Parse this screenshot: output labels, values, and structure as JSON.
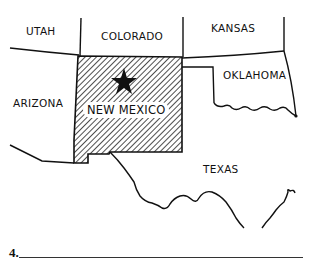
{
  "map": {
    "highlighted_state": "NEW MEXICO",
    "marker": "star-icon",
    "hatch_color": "#222222",
    "line_color": "#111111",
    "states": [
      {
        "id": "utah",
        "label": "UTAH"
      },
      {
        "id": "colorado",
        "label": "COLORADO"
      },
      {
        "id": "kansas",
        "label": "KANSAS"
      },
      {
        "id": "arizona",
        "label": "ARIZONA"
      },
      {
        "id": "new-mexico",
        "label": "NEW MEXICO"
      },
      {
        "id": "oklahoma",
        "label": "OKLAHOMA"
      },
      {
        "id": "texas",
        "label": "TEXAS"
      }
    ]
  },
  "question": {
    "number": "4.",
    "answer": ""
  }
}
